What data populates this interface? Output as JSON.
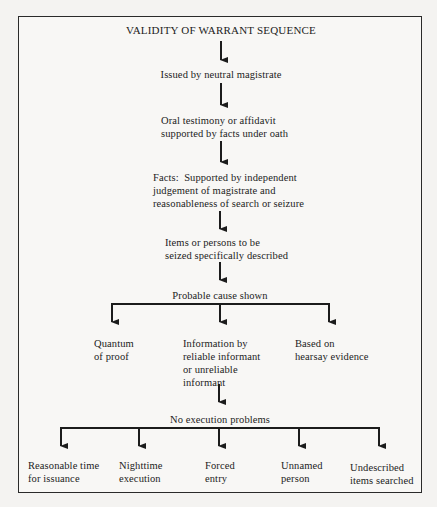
{
  "diagram": {
    "title": "VALIDITY OF WARRANT SEQUENCE",
    "sequence": [
      {
        "id": "issued",
        "lines": [
          "Issued by neutral magistrate"
        ]
      },
      {
        "id": "oral",
        "lines": [
          "Oral testimony or affidavit",
          "supported by facts under oath"
        ]
      },
      {
        "id": "facts",
        "lines": [
          "Facts:  Supported by independent",
          "judgement of magistrate and",
          "reasonableness of search or seizure"
        ]
      },
      {
        "id": "items",
        "lines": [
          "Items or persons to be",
          "seized specifically described"
        ]
      },
      {
        "id": "probable",
        "lines": [
          "Probable cause shown"
        ]
      }
    ],
    "probable_cause_branches": [
      {
        "id": "quantum",
        "lines": [
          "Quantum",
          "of proof"
        ]
      },
      {
        "id": "information",
        "lines": [
          "Information by",
          "reliable informant",
          "or unreliable",
          "informant"
        ]
      },
      {
        "id": "hearsay",
        "lines": [
          "Based on",
          "hearsay evidence"
        ]
      }
    ],
    "execution": {
      "lines": [
        "No execution problems"
      ]
    },
    "execution_branches": [
      {
        "id": "reasonable-time",
        "lines": [
          "Reasonable time",
          "for issuance"
        ]
      },
      {
        "id": "nighttime",
        "lines": [
          "Nighttime",
          "execution"
        ]
      },
      {
        "id": "forced-entry",
        "lines": [
          "Forced",
          "entry"
        ]
      },
      {
        "id": "unnamed-person",
        "lines": [
          "Unnamed",
          "person"
        ]
      },
      {
        "id": "undescribed-items",
        "lines": [
          "Undescribed",
          "items searched"
        ]
      }
    ],
    "colors": {
      "ink": "#1c1c1c",
      "paper": "#f8f7f5",
      "border": "#2a2a2a"
    }
  }
}
